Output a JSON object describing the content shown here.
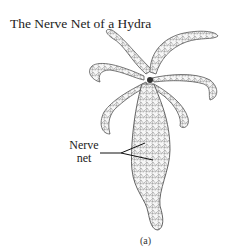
{
  "figure": {
    "title": "The Nerve Net of a Hydra",
    "labels": [
      {
        "line1": "Nerve",
        "line2": "net"
      }
    ],
    "caption": "(a)",
    "colors": {
      "ink": "#333333",
      "fill": "#f4f4f4",
      "background": "#ffffff"
    }
  }
}
